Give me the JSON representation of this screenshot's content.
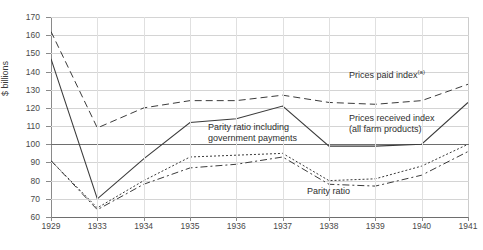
{
  "chart_data": {
    "type": "line",
    "title": "",
    "xlabel": "",
    "ylabel": "$ billions",
    "ylim": [
      60,
      170
    ],
    "ytick_labels": [
      "170",
      "160",
      "150",
      "140",
      "130",
      "120",
      "110",
      "100",
      "90",
      "80",
      "70",
      "60"
    ],
    "ytick_values": [
      170,
      160,
      150,
      140,
      130,
      120,
      110,
      100,
      90,
      80,
      70,
      60
    ],
    "grid": true,
    "reference_line": 100,
    "legend_position": "inline-annotations",
    "categories": [
      "1929",
      "1933",
      "1934",
      "1935",
      "1936",
      "1937",
      "1938",
      "1939",
      "1940",
      "1941"
    ],
    "x": [
      1929,
      1933,
      1934,
      1935,
      1936,
      1937,
      1938,
      1939,
      1940,
      1941
    ],
    "series": [
      {
        "name": "Prices paid index (a)",
        "style": "dashed",
        "values": [
          162,
          109,
          120,
          124,
          124,
          127,
          123,
          122,
          124,
          133
        ]
      },
      {
        "name": "Parity ratio including government payments",
        "style": "solid",
        "values": [
          147,
          70,
          92,
          112,
          114,
          121,
          99,
          99,
          100,
          123
        ]
      },
      {
        "name": "Prices received index (all farm products)",
        "style": "solid",
        "values": [
          147,
          70,
          92,
          112,
          114,
          121,
          99,
          99,
          100,
          123
        ]
      },
      {
        "name": "Parity ratio",
        "style": "dash-dot",
        "values": [
          91,
          64,
          78,
          87,
          89,
          93,
          78,
          77,
          83,
          96
        ]
      },
      {
        "name": "Parity ratio including government payments (dotted)",
        "style": "dotted",
        "values": [
          91,
          65,
          80,
          93,
          94,
          95,
          80,
          81,
          88,
          100
        ]
      }
    ],
    "annotations": [
      {
        "text": "Prices paid index",
        "superscript": "(a)",
        "x": 350,
        "y": 72
      },
      {
        "text": "Prices received index",
        "text2": "(all farm products)",
        "x": 350,
        "y": 118
      },
      {
        "text": "Parity ratio including",
        "text2": "government payments",
        "x": 208,
        "y": 126
      },
      {
        "text": "Parity ratio",
        "x": 307,
        "y": 190
      }
    ],
    "footnote": "",
    "colors": {
      "line": "#3b3b3b",
      "grid": "#d4d4d4",
      "axis": "#8a8a8a",
      "reference": "#6e6e6e",
      "background": "#ffffff"
    }
  },
  "axis": {
    "y_label": "$ billions"
  },
  "labels": {
    "prices_paid": "Prices paid index",
    "prices_paid_sup": "(a)",
    "prices_received_l1": "Prices received index",
    "prices_received_l2": "(all farm products)",
    "parity_gov_l1": "Parity ratio including",
    "parity_gov_l2": "government payments",
    "parity_ratio": "Parity ratio"
  }
}
